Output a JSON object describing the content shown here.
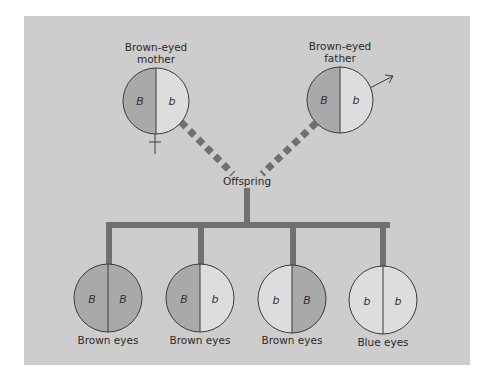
{
  "colors": {
    "background": "#cdcdcd",
    "dominant_fill": "#a9a9a9",
    "recessive_fill": "#dddddd",
    "connector": "#707070",
    "outline": "#3a3a3a"
  },
  "parents": {
    "mother": {
      "title_line1": "Brown-eyed",
      "title_line2": "mother",
      "left_allele": "B",
      "right_allele": "b",
      "sex_symbol": "female-venus"
    },
    "father": {
      "title_line1": "Brown-eyed",
      "title_line2": "father",
      "left_allele": "B",
      "right_allele": "b",
      "sex_symbol": "male-mars"
    }
  },
  "offspring_label": "Offspring",
  "offspring": [
    {
      "left_allele": "B",
      "right_allele": "B",
      "phenotype": "Brown eyes"
    },
    {
      "left_allele": "B",
      "right_allele": "b",
      "phenotype": "Brown eyes"
    },
    {
      "left_allele": "b",
      "right_allele": "B",
      "phenotype": "Brown eyes"
    },
    {
      "left_allele": "b",
      "right_allele": "b",
      "phenotype": "Blue eyes"
    }
  ]
}
